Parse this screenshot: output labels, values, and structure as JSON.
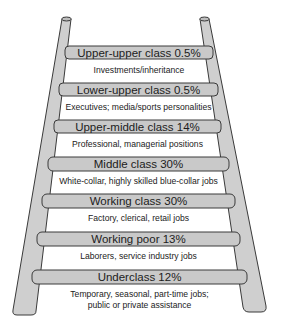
{
  "diagram": {
    "type": "ladder",
    "colors": {
      "rail_fill": "#cfcfcf",
      "rung_fill": "#c9c9c9",
      "outline": "#3a3a3a",
      "background": "#ffffff"
    },
    "rungs": [
      {
        "label": "Upper-upper class 0.5%",
        "class": "Upper-upper class",
        "percent": 0.5,
        "description": "Investments/inheritance"
      },
      {
        "label": "Lower-upper class 0.5%",
        "class": "Lower-upper class",
        "percent": 0.5,
        "description": "Executives; media/sports personalities"
      },
      {
        "label": "Upper-middle class 14%",
        "class": "Upper-middle class",
        "percent": 14,
        "description": "Professional, managerial positions"
      },
      {
        "label": "Middle class 30%",
        "class": "Middle class",
        "percent": 30,
        "description": "White-collar, highly skilled blue-collar jobs"
      },
      {
        "label": "Working class 30%",
        "class": "Working class",
        "percent": 30,
        "description": "Factory, clerical, retail jobs"
      },
      {
        "label": "Working poor 13%",
        "class": "Working poor",
        "percent": 13,
        "description": "Laborers, service industry jobs"
      },
      {
        "label": "Underclass 12%",
        "class": "Underclass",
        "percent": 12,
        "description": "Temporary, seasonal, part-time jobs;",
        "description_line2": "public or private assistance"
      }
    ]
  }
}
